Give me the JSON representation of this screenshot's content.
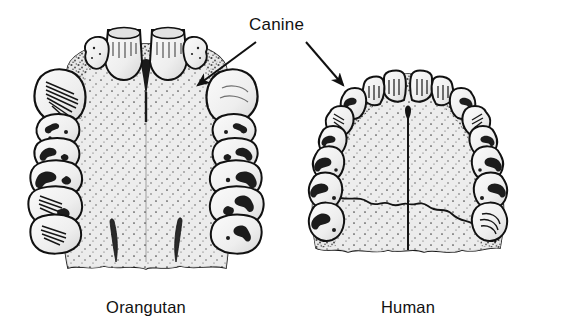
{
  "figure": {
    "background_color": "#ffffff",
    "ink_color": "#111111",
    "palate_fill_color": "#ededed",
    "tooth_fill_color": "#f2f2f2",
    "width": 561,
    "height": 332
  },
  "callout": {
    "label": "Canine",
    "label_x": 249,
    "label_y": 16,
    "arrows": [
      {
        "name": "arrow-to-orangutan-canine",
        "from_x": 256,
        "from_y": 42,
        "to_x": 196,
        "to_y": 86,
        "points_to": "Orangutan"
      },
      {
        "name": "arrow-to-human-canine",
        "from_x": 306,
        "from_y": 42,
        "to_x": 344,
        "to_y": 86,
        "points_to": "Human"
      }
    ]
  },
  "specimens": [
    {
      "id": "orangutan",
      "label": "Orangutan",
      "label_x": 91,
      "label_y": 299,
      "arcade_shape": "U-shaped",
      "canine_size": "large, projecting",
      "center_x": 146,
      "drawing_bounds": {
        "x": 30,
        "y": 26,
        "width": 232,
        "height": 252
      }
    },
    {
      "id": "human",
      "label": "Human",
      "label_x": 363,
      "label_y": 299,
      "arcade_shape": "parabolic",
      "canine_size": "small, in line with other teeth",
      "center_x": 408,
      "drawing_bounds": {
        "x": 300,
        "y": 72,
        "width": 236,
        "height": 206
      }
    }
  ]
}
